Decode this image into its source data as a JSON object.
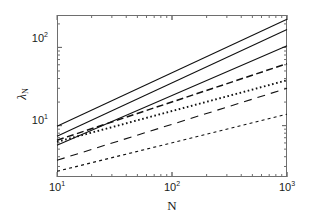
{
  "figure": {
    "background": "#ffffff",
    "axis_color": "#6e6e6e",
    "line_color": "#111111"
  },
  "axes": {
    "x_title": "N",
    "y_title_base": "λ",
    "y_title_sub": "N",
    "x_ticks": [
      {
        "label_mantissa": "10",
        "label_exp": "1",
        "value": 10
      },
      {
        "label_mantissa": "10",
        "label_exp": "2",
        "value": 100
      },
      {
        "label_mantissa": "10",
        "label_exp": "3",
        "value": 1000
      }
    ],
    "y_ticks": [
      {
        "label_mantissa": "10",
        "label_exp": "1",
        "value": 10
      },
      {
        "label_mantissa": "10",
        "label_exp": "2",
        "value": 100
      }
    ],
    "x_scale": "log",
    "y_scale": "log",
    "xlim": [
      10,
      1000
    ],
    "ylim": [
      2.2,
      260
    ],
    "grid": false
  },
  "chart_data": {
    "type": "line",
    "title": "",
    "subtitle": "",
    "xlabel": "N",
    "ylabel": "λ_N",
    "xscale": "log",
    "yscale": "log",
    "xlim": [
      10,
      1000
    ],
    "ylim": [
      2.2,
      260
    ],
    "grid": false,
    "legend": "none",
    "x": [
      10,
      1000
    ],
    "series": [
      {
        "name": "solid-1",
        "style": "solid",
        "values": [
          9.8,
          230
        ]
      },
      {
        "name": "solid-2",
        "style": "solid",
        "values": [
          7.3,
          170
        ]
      },
      {
        "name": "solid-3",
        "style": "solid",
        "values": [
          5.6,
          105
        ]
      },
      {
        "name": "dashed-1",
        "style": "dashed",
        "values": [
          6.5,
          62
        ]
      },
      {
        "name": "dotted-1",
        "style": "dotted",
        "values": [
          6.2,
          38
        ]
      },
      {
        "name": "longdash-1",
        "style": "longdash",
        "values": [
          3.6,
          30
        ]
      },
      {
        "name": "finedash-1",
        "style": "finedash",
        "values": [
          2.6,
          14
        ]
      }
    ]
  }
}
